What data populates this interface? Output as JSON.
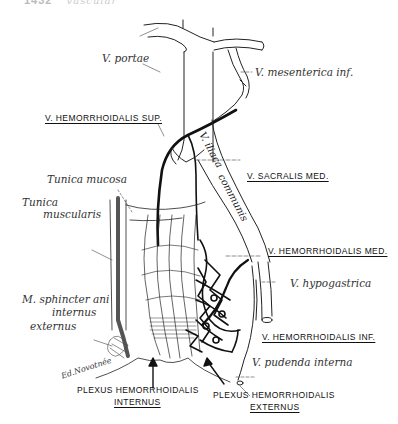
{
  "header": {
    "page_number": "1432",
    "running_title": "vascular"
  },
  "figure": {
    "labels": {
      "v_portae": "V. portae",
      "v_mesenterica_inf": "V. mesenterica inf.",
      "v_hemorrhoidalis_sup": "V. HEMORRHOIDALIS SUP.",
      "v_iliaca_1": "V. iliaca",
      "v_iliaca_2": "communis",
      "v_sacralis_med": "V. SACRALIS MED.",
      "tunica_mucosa": "Tunica mucosa",
      "tunica_muscularis_1": "Tunica",
      "tunica_muscularis_2": "muscularis",
      "v_hemorrhoidalis_med": "V. HEMORRHOIDALIS MED.",
      "v_hypogastrica": "V. hypogastrica",
      "m_sphincter_1": "M. sphincter ani",
      "m_sphincter_2": "internus",
      "m_sphincter_3": "externus",
      "v_hemorrhoidalis_inf": "V. HEMORRHOIDALIS INF.",
      "v_pudenda_interna": "V. pudenda interna",
      "plexus_internus_1": "PLEXUS HEMORRHOIDALIS",
      "plexus_internus_2": "INTERNUS",
      "plexus_externus_1": "PLEXUS HEMORRHOIDALIS",
      "plexus_externus_2": "EXTERNUS",
      "signature": "Ed.Novotnée"
    },
    "colors": {
      "ink": "#111111",
      "thin_line": "#444444",
      "background": "#ffffff"
    }
  }
}
